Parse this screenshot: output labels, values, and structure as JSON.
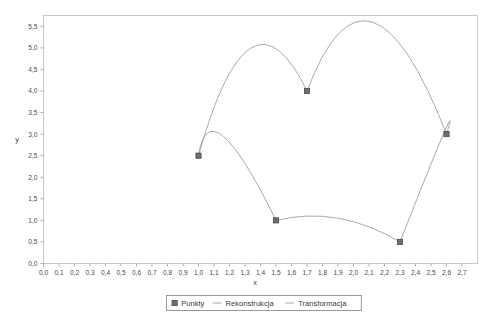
{
  "chart_data": {
    "type": "line",
    "title": "",
    "xlabel": "x",
    "ylabel": "y",
    "xlim": [
      0.0,
      2.8
    ],
    "ylim": [
      0.0,
      5.75
    ],
    "grid": false,
    "legend_position": "bottom",
    "xticks": [
      "0,0",
      "0,1",
      "0,2",
      "0,3",
      "0,4",
      "0,5",
      "0,6",
      "0,7",
      "0,8",
      "0,9",
      "1,0",
      "1,1",
      "1,2",
      "1,3",
      "1,4",
      "1,5",
      "1,6",
      "1,7",
      "1,8",
      "1,9",
      "2,0",
      "2,1",
      "2,2",
      "2,3",
      "2,4",
      "2,5",
      "2,6",
      "2,7"
    ],
    "xtick_values": [
      0.0,
      0.1,
      0.2,
      0.3,
      0.4,
      0.5,
      0.6,
      0.7,
      0.8,
      0.9,
      1.0,
      1.1,
      1.2,
      1.3,
      1.4,
      1.5,
      1.6,
      1.7,
      1.8,
      1.9,
      2.0,
      2.1,
      2.2,
      2.3,
      2.4,
      2.5,
      2.6,
      2.7
    ],
    "yticks": [
      "0,0",
      "0,5",
      "1,0",
      "1,5",
      "2,0",
      "2,5",
      "3,0",
      "3,5",
      "4,0",
      "4,5",
      "5,0",
      "5,5"
    ],
    "ytick_values": [
      0.0,
      0.5,
      1.0,
      1.5,
      2.0,
      2.5,
      3.0,
      3.5,
      4.0,
      4.5,
      5.0,
      5.5
    ],
    "series": [
      {
        "name": "Punkty",
        "type": "scatter",
        "marker": "square",
        "color": "#6e6e6e",
        "points": [
          {
            "x": 1.0,
            "y": 2.5
          },
          {
            "x": 1.5,
            "y": 1.0
          },
          {
            "x": 1.7,
            "y": 4.0
          },
          {
            "x": 2.3,
            "y": 0.5
          },
          {
            "x": 2.6,
            "y": 3.0
          }
        ]
      },
      {
        "name": "Rekonstrukcja",
        "type": "line",
        "color": "#a0a0a0",
        "arcs": [
          {
            "from": {
              "x": 1.0,
              "y": 2.5
            },
            "to": {
              "x": 1.7,
              "y": 4.0
            },
            "peak": {
              "x": 1.34,
              "y": 5.0
            }
          },
          {
            "from": {
              "x": 1.7,
              "y": 4.0
            },
            "to": {
              "x": 2.6,
              "y": 3.0
            },
            "peak": {
              "x": 2.12,
              "y": 5.6
            }
          }
        ]
      },
      {
        "name": "Transformacja",
        "type": "line",
        "color": "#a0a0a0",
        "arcs": [
          {
            "from": {
              "x": 1.0,
              "y": 2.5
            },
            "to": {
              "x": 1.5,
              "y": 1.0
            },
            "peak": {
              "x": 1.16,
              "y": 2.95
            }
          },
          {
            "from": {
              "x": 1.5,
              "y": 1.0
            },
            "to": {
              "x": 2.3,
              "y": 0.5
            },
            "peak": {
              "x": 1.9,
              "y": 1.05
            }
          },
          {
            "from": {
              "x": 2.3,
              "y": 0.5
            },
            "to": {
              "x": 2.6,
              "y": 3.0
            },
            "peak": {
              "x": 2.58,
              "y": 3.0
            }
          }
        ]
      }
    ]
  },
  "axes": {
    "y_name": "y",
    "x_name": "x"
  },
  "legend": {
    "items": [
      {
        "label": "Punkty",
        "glyph": "square-marker"
      },
      {
        "label": "Rekonstrukcja",
        "glyph": "line-dash"
      },
      {
        "label": "Transformacja",
        "glyph": "line-dash"
      }
    ]
  },
  "colors": {
    "marker": "#6e6e6e",
    "curve": "#a0a0a0",
    "frame": "#c9c9c9",
    "text": "#3a3a3a",
    "background": "#ffffff"
  }
}
